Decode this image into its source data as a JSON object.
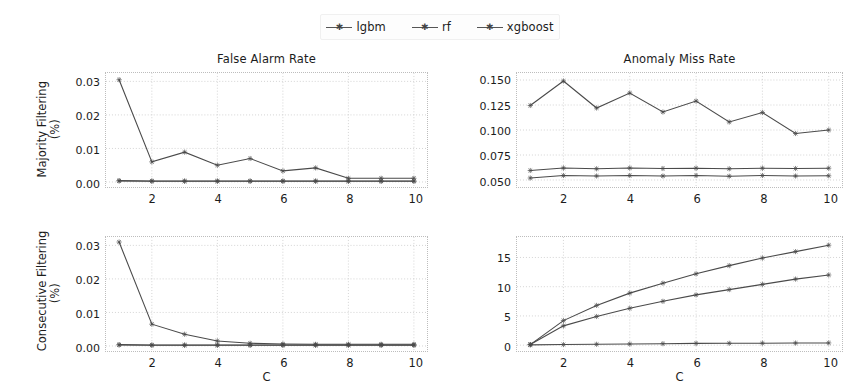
{
  "figure": {
    "background": "#ffffff",
    "line_color": "#4a4a4a",
    "grid_color": "#c9c9c9"
  },
  "legend": {
    "position": "top-center",
    "entries": [
      {
        "label": "lgbm",
        "marker": "star-marker"
      },
      {
        "label": "rf",
        "marker": "star-marker"
      },
      {
        "label": "xgboost",
        "marker": "star-marker"
      }
    ]
  },
  "chart_data": [
    {
      "type": "line",
      "panel": "top-left",
      "title": "False Alarm Rate",
      "xlabel": "",
      "ylabel": "Majority Filtering\n(%)",
      "ylabel_line1": "Majority Filtering",
      "ylabel_line2": "(%)",
      "x": [
        1,
        2,
        3,
        4,
        5,
        6,
        7,
        8,
        9,
        10
      ],
      "xlim": [
        0.6,
        10.4
      ],
      "ylim": [
        -0.0015,
        0.0325
      ],
      "xticks": [
        2,
        4,
        6,
        8,
        10
      ],
      "yticks": [
        0.0,
        0.01,
        0.02,
        0.03
      ],
      "ytick_labels": [
        "0.00",
        "0.01",
        "0.02",
        "0.03"
      ],
      "xtick_labels": [
        "2",
        "4",
        "6",
        "8",
        "10"
      ],
      "grid": true,
      "series": [
        {
          "name": "lgbm",
          "values": [
            0.0305,
            0.006,
            0.0089,
            0.005,
            0.007,
            0.0033,
            0.0042,
            0.0011,
            0.0011,
            0.0011
          ]
        },
        {
          "name": "rf",
          "values": [
            0.0004,
            0.0003,
            0.0003,
            0.0003,
            0.0003,
            0.0003,
            0.0003,
            0.0003,
            0.0003,
            0.0003
          ]
        },
        {
          "name": "xgboost",
          "values": [
            0.0003,
            0.0002,
            0.0002,
            0.0002,
            0.0002,
            0.0002,
            0.0002,
            0.0002,
            0.0002,
            0.0002
          ]
        }
      ]
    },
    {
      "type": "line",
      "panel": "top-right",
      "title": "Anomaly Miss Rate",
      "xlabel": "",
      "ylabel": "",
      "x": [
        1,
        2,
        3,
        4,
        5,
        6,
        7,
        8,
        9,
        10
      ],
      "xlim": [
        0.6,
        10.4
      ],
      "ylim": [
        0.043,
        0.157
      ],
      "xticks": [
        2,
        4,
        6,
        8,
        10
      ],
      "yticks": [
        0.05,
        0.075,
        0.1,
        0.125,
        0.15
      ],
      "ytick_labels": [
        "0.050",
        "0.075",
        "0.100",
        "0.125",
        "0.150"
      ],
      "xtick_labels": [
        "2",
        "4",
        "6",
        "8",
        "10"
      ],
      "grid": true,
      "series": [
        {
          "name": "lgbm",
          "values": [
            0.1245,
            0.149,
            0.122,
            0.137,
            0.118,
            0.129,
            0.108,
            0.1175,
            0.0965,
            0.1
          ]
        },
        {
          "name": "rf",
          "values": [
            0.0595,
            0.062,
            0.0612,
            0.062,
            0.0615,
            0.0618,
            0.0612,
            0.0618,
            0.0615,
            0.0618
          ]
        },
        {
          "name": "xgboost",
          "values": [
            0.052,
            0.0545,
            0.054,
            0.0545,
            0.054,
            0.0545,
            0.0538,
            0.0545,
            0.054,
            0.0542
          ]
        }
      ]
    },
    {
      "type": "line",
      "panel": "bottom-left",
      "title": "",
      "xlabel": "C",
      "ylabel": "Consecutive Filtering\n(%)",
      "ylabel_line1": "Consecutive Filtering",
      "ylabel_line2": "(%)",
      "x": [
        1,
        2,
        3,
        4,
        5,
        6,
        7,
        8,
        9,
        10
      ],
      "xlim": [
        0.6,
        10.4
      ],
      "ylim": [
        -0.0015,
        0.0325
      ],
      "xticks": [
        2,
        4,
        6,
        8,
        10
      ],
      "yticks": [
        0.0,
        0.01,
        0.02,
        0.03
      ],
      "ytick_labels": [
        "0.00",
        "0.01",
        "0.02",
        "0.03"
      ],
      "xtick_labels": [
        "2",
        "4",
        "6",
        "8",
        "10"
      ],
      "grid": true,
      "series": [
        {
          "name": "lgbm",
          "values": [
            0.031,
            0.0065,
            0.0035,
            0.0015,
            0.0008,
            0.0006,
            0.0005,
            0.0005,
            0.0005,
            0.0005
          ]
        },
        {
          "name": "rf",
          "values": [
            0.0004,
            0.0003,
            0.0003,
            0.0003,
            0.0003,
            0.0003,
            0.0003,
            0.0003,
            0.0003,
            0.0003
          ]
        },
        {
          "name": "xgboost",
          "values": [
            0.0003,
            0.0002,
            0.0002,
            0.0002,
            0.0002,
            0.0002,
            0.0002,
            0.0002,
            0.0002,
            0.0002
          ]
        }
      ]
    },
    {
      "type": "line",
      "panel": "bottom-right",
      "title": "",
      "xlabel": "C",
      "ylabel": "",
      "x": [
        1,
        2,
        3,
        4,
        5,
        6,
        7,
        8,
        9,
        10
      ],
      "xlim": [
        0.6,
        10.4
      ],
      "ylim": [
        -1.0,
        18.5
      ],
      "xticks": [
        2,
        4,
        6,
        8,
        10
      ],
      "yticks": [
        0,
        5,
        10,
        15
      ],
      "ytick_labels": [
        "0",
        "5",
        "10",
        "15"
      ],
      "xtick_labels": [
        "2",
        "4",
        "6",
        "8",
        "10"
      ],
      "grid": true,
      "series": [
        {
          "name": "lgbm",
          "values": [
            0.05,
            0.1,
            0.15,
            0.2,
            0.25,
            0.3,
            0.32,
            0.34,
            0.36,
            0.38
          ]
        },
        {
          "name": "rf",
          "values": [
            0.1,
            4.2,
            6.8,
            8.9,
            10.6,
            12.2,
            13.6,
            14.9,
            16.0,
            17.1
          ]
        },
        {
          "name": "xgboost",
          "values": [
            0.1,
            3.3,
            4.9,
            6.3,
            7.5,
            8.6,
            9.5,
            10.4,
            11.3,
            12.0
          ]
        }
      ]
    }
  ]
}
